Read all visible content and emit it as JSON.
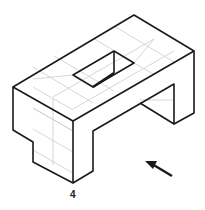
{
  "figure": {
    "label": "4",
    "arrow": "direction-arrow"
  },
  "colors": {
    "stroke": "#1a1a1a",
    "grid": "#cccccc",
    "background": "#ffffff"
  }
}
